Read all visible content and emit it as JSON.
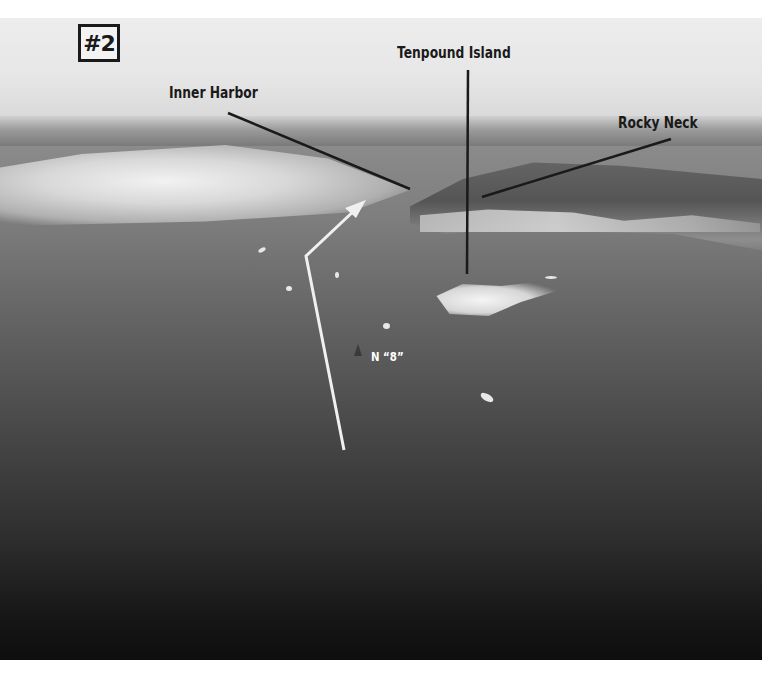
{
  "figure": {
    "badge": "#2"
  },
  "labels": {
    "tenpound_island": "Tenpound Island",
    "inner_harbor": "Inner Harbor",
    "rocky_neck": "Rocky Neck",
    "buoy": "N “8”"
  },
  "icons": {
    "route_arrow": "route-arrow-icon",
    "buoy_marker": "nun-buoy-icon"
  },
  "colors": {
    "callout_text": "#1a1a1a",
    "callout_line": "#1a1a1a",
    "route_arrow": "#f0f0f0",
    "page_background": "#ffffff"
  }
}
